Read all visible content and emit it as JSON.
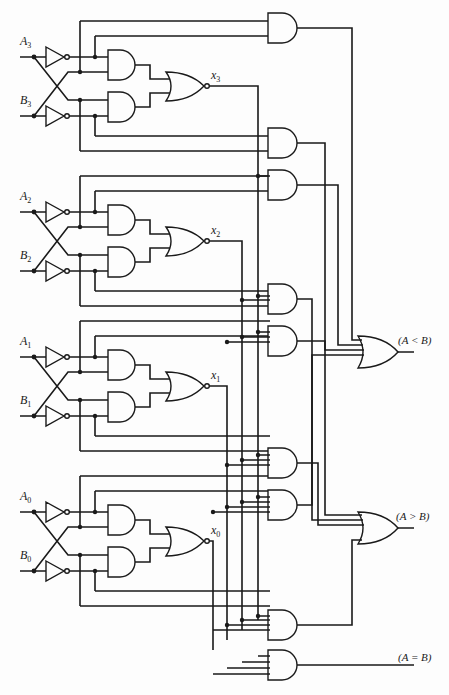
{
  "inputs": [
    {
      "name": "A",
      "sub": "3"
    },
    {
      "name": "B",
      "sub": "3"
    },
    {
      "name": "A",
      "sub": "2"
    },
    {
      "name": "B",
      "sub": "2"
    },
    {
      "name": "A",
      "sub": "1"
    },
    {
      "name": "B",
      "sub": "1"
    },
    {
      "name": "A",
      "sub": "0"
    },
    {
      "name": "B",
      "sub": "0"
    }
  ],
  "intermediate": [
    {
      "name": "x",
      "sub": "3"
    },
    {
      "name": "x",
      "sub": "2"
    },
    {
      "name": "x",
      "sub": "1"
    },
    {
      "name": "x",
      "sub": "0"
    }
  ],
  "outputs": {
    "less": "(A < B)",
    "greater": "(A > B)",
    "equal": "(A = B)"
  },
  "colors": {
    "line": "#1a1a1a",
    "background": "#fdfdfd"
  }
}
